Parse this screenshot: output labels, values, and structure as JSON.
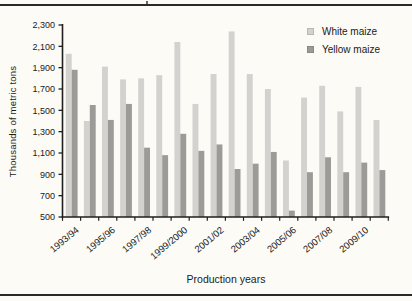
{
  "figure": {
    "background": "#fcfbf6",
    "axis_color": "#1f1f1f",
    "text_color": "#1a1a1a",
    "rule_color": "#2b2a28"
  },
  "chart_data": {
    "type": "bar",
    "title": "",
    "xlabel": "Production years",
    "ylabel": "Thousands of metric tons",
    "ylim": [
      500,
      2300
    ],
    "ytick_step": 200,
    "ytick_labels": [
      "500",
      "700",
      "900",
      "1,100",
      "1,300",
      "1,500",
      "1,700",
      "1,900",
      "2,100",
      "2,300"
    ],
    "categories": [
      "1993/94",
      "1994/95",
      "1995/96",
      "1996/97",
      "1997/98",
      "1998/99",
      "1999/2000",
      "2000/01",
      "2001/02",
      "2002/03",
      "2003/04",
      "2004/05",
      "2005/06",
      "2006/07",
      "2007/08",
      "2008/09",
      "2009/10",
      "2010/11"
    ],
    "xtick_label_every": 2,
    "xtick_labels_shown": [
      "1993/94",
      "1995/96",
      "1997/98",
      "1999/2000",
      "2001/02",
      "2003/04",
      "2005/06",
      "2007/08",
      "2009/10"
    ],
    "grid": false,
    "legend_position": "top-right",
    "series": [
      {
        "name": "White maize",
        "color": "#d3d2cf",
        "values": [
          2030,
          1400,
          1910,
          1790,
          1800,
          1830,
          2140,
          1560,
          1840,
          2240,
          1840,
          1700,
          1030,
          1620,
          1730,
          1490,
          1720,
          1410
        ]
      },
      {
        "name": "Yellow maize",
        "color": "#9c9b98",
        "values": [
          1880,
          1550,
          1410,
          1560,
          1150,
          1080,
          1280,
          1120,
          1180,
          950,
          1000,
          1110,
          560,
          920,
          1060,
          920,
          1010,
          940
        ]
      }
    ]
  }
}
